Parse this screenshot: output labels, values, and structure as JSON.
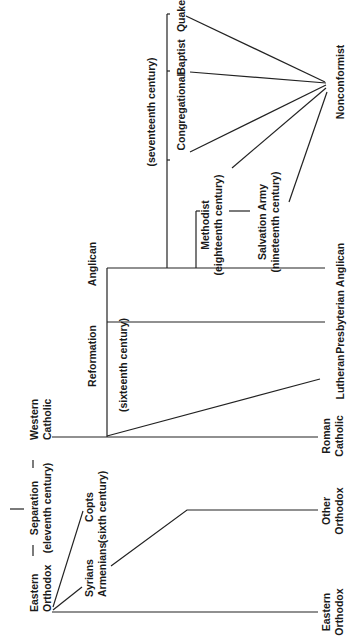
{
  "diagram": {
    "orientation": "rotated-90-ccw",
    "line_color": "#222222",
    "text_color": "#1a1a1a",
    "background": "#ffffff",
    "nodes": {
      "eastern_orthodox_root": {
        "line1": "Eastern",
        "line2": "Orthodox"
      },
      "separation": {
        "line1": "Separation",
        "line2": "(eleventh century)"
      },
      "western_catholic": {
        "line1": "Western",
        "line2": "Catholic"
      },
      "syrians_armenians": {
        "line1": "Syrians",
        "line2": "Armenians"
      },
      "copts": {
        "line1": "Copts",
        "line2": "(sixth century)"
      },
      "reformation": {
        "line1": "Reformation",
        "line2": "(sixteenth century)"
      },
      "anglican_top": {
        "label": "Anglican"
      },
      "seventeenth_century": {
        "label": "(seventeenth century)"
      },
      "congregational": {
        "label": "Congregational"
      },
      "baptist": {
        "label": "Baptist"
      },
      "quaker": {
        "label": "Quaker"
      },
      "methodist": {
        "line1": "Methodist",
        "line2": "(eighteenth century)"
      },
      "salvation_army": {
        "line1": "Salvation Army",
        "line2": "(nineteenth century)"
      },
      "nonconformist": {
        "label": "Nonconformist"
      }
    },
    "leaves": [
      {
        "line1": "Eastern",
        "line2": "Orthodox"
      },
      {
        "line1": "Other",
        "line2": "Orthodox"
      },
      {
        "line1": "Roman",
        "line2": "Catholic"
      },
      {
        "line1": "Lutheran",
        "line2": ""
      },
      {
        "line1": "Presbyterian",
        "line2": ""
      },
      {
        "line1": "Anglican",
        "line2": ""
      }
    ]
  }
}
